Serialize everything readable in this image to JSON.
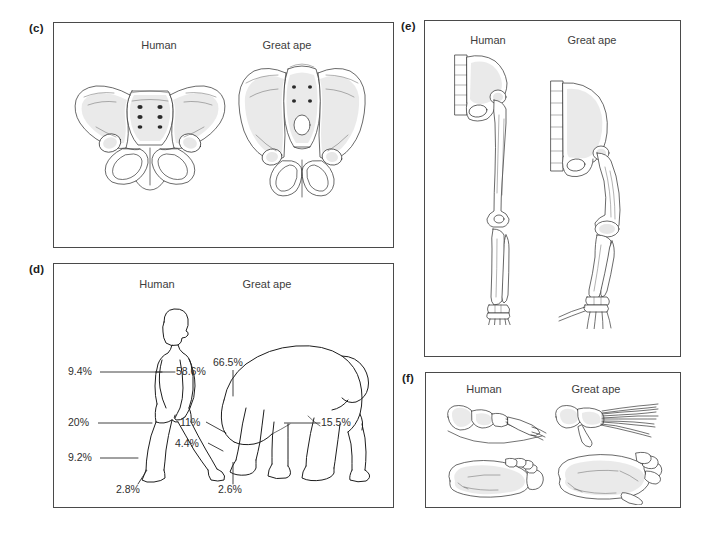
{
  "figure": {
    "background": "#ffffff",
    "ink_color": "#1d1d1d",
    "text_color": "#3a3a3a"
  },
  "panels": [
    {
      "id": "c",
      "letter": "(c)",
      "subject": "pelvis-comparison",
      "columns": [
        {
          "label": "Human"
        },
        {
          "label": "Great ape"
        }
      ]
    },
    {
      "id": "d",
      "letter": "(d)",
      "subject": "body-mass-distribution",
      "columns": [
        {
          "label": "Human"
        },
        {
          "label": "Great ape"
        }
      ],
      "human_values": [
        {
          "label": "9.4%",
          "part": "upper-limb"
        },
        {
          "label": "58.6%",
          "part": "head-trunk"
        },
        {
          "label": "20%",
          "part": "thigh"
        },
        {
          "label": "9.2%",
          "part": "leg"
        },
        {
          "label": "2.8%",
          "part": "foot"
        }
      ],
      "ape_values": [
        {
          "label": "66.5%",
          "part": "head-trunk"
        },
        {
          "label": "11%",
          "part": "upper-limb"
        },
        {
          "label": "4.4%",
          "part": "forearm-hand"
        },
        {
          "label": "15.5%",
          "part": "thigh"
        },
        {
          "label": "2.6%",
          "part": "foot"
        }
      ]
    },
    {
      "id": "e",
      "letter": "(e)",
      "subject": "hindlimb-skeleton-comparison",
      "columns": [
        {
          "label": "Human"
        },
        {
          "label": "Great ape"
        }
      ]
    },
    {
      "id": "f",
      "letter": "(f)",
      "subject": "foot-comparison",
      "columns": [
        {
          "label": "Human"
        },
        {
          "label": "Great ape"
        }
      ]
    }
  ]
}
